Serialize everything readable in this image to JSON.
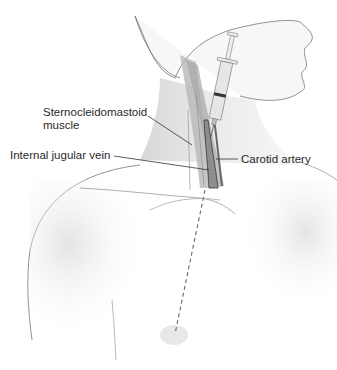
{
  "figure": {
    "labels": {
      "scm_line1": "Sternocleidomastoid",
      "scm_line2": "muscle",
      "ijv": "Internal jugular vein",
      "carotid": "Carotid artery"
    },
    "icons": {
      "syringe": "syringe-icon",
      "needle_path": "dashed-line-to-nipple"
    },
    "colors": {
      "outline": "#6a6a6a",
      "skin_shade": "#e4e4e4",
      "muscle": "#9a9a9a",
      "vein": "#5a5a5a",
      "text": "#2a2a2a"
    }
  }
}
